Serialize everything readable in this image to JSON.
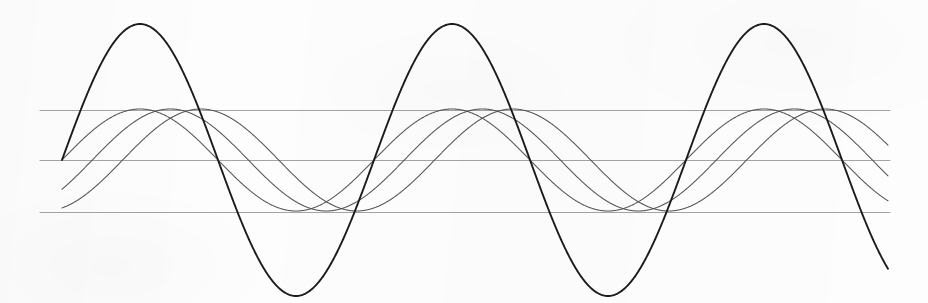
{
  "figure": {
    "background_color": "#fdfdfd",
    "width": 928,
    "height": 303
  },
  "chart_data": {
    "type": "line",
    "title": "",
    "xlabel": "",
    "ylabel": "",
    "grid": true,
    "legend_position": "none",
    "x_pixel_domain": [
      62,
      888
    ],
    "y_baseline_pixel": 160,
    "xlim": [
      0,
      2.65
    ],
    "ylim": [
      -1.0,
      1.0
    ],
    "x_unit": "periods",
    "gridlines": [
      {
        "name": "upper-gridline",
        "y_pixel": 110,
        "value": 0.385,
        "color": "#9a9a9a",
        "x_start": 40,
        "x_end": 890
      },
      {
        "name": "center-gridline",
        "y_pixel": 160,
        "value": 0.0,
        "color": "#9a9a9a",
        "x_start": 40,
        "x_end": 890
      },
      {
        "name": "lower-gridline",
        "y_pixel": 212,
        "value": -0.4,
        "color": "#9a9a9a",
        "x_start": 40,
        "x_end": 890
      }
    ],
    "series": [
      {
        "name": "fundamental-large-amplitude",
        "color": "#1c1c1c",
        "line_width": 1.9,
        "amplitude": 1.0,
        "amplitude_pixels": 136,
        "period_pixels": 312,
        "phase_degrees": 0,
        "x_start_pixel": 62,
        "x_end_pixel": 888,
        "peaks_pixel": [
          [
            155,
            24
          ],
          [
            467,
            24
          ],
          [
            779,
            24
          ]
        ],
        "troughs_pixel": [
          [
            311,
            289
          ],
          [
            623,
            289
          ]
        ]
      },
      {
        "name": "harmonic-phase-a",
        "color": "#555555",
        "line_width": 1.05,
        "amplitude": 0.375,
        "amplitude_pixels": 51,
        "period_pixels": 312,
        "phase_degrees": 0,
        "x_start_pixel": 62,
        "x_end_pixel": 888,
        "peaks_pixel": [
          [
            134,
            110
          ],
          [
            446,
            110
          ],
          [
            758,
            110
          ]
        ],
        "troughs_pixel": [
          [
            290,
            212
          ],
          [
            602,
            212
          ]
        ]
      },
      {
        "name": "harmonic-phase-b",
        "color": "#555555",
        "line_width": 1.05,
        "amplitude": 0.375,
        "amplitude_pixels": 51,
        "period_pixels": 312,
        "phase_degrees": -35,
        "x_start_pixel": 62,
        "x_end_pixel": 888,
        "peaks_pixel": [
          [
            165,
            110
          ],
          [
            477,
            110
          ],
          [
            789,
            110
          ]
        ],
        "troughs_pixel": [
          [
            321,
            212
          ],
          [
            633,
            212
          ]
        ]
      },
      {
        "name": "harmonic-phase-c",
        "color": "#555555",
        "line_width": 1.05,
        "amplitude": 0.375,
        "amplitude_pixels": 51,
        "period_pixels": 312,
        "phase_degrees": -70,
        "x_start_pixel": 62,
        "x_end_pixel": 888,
        "peaks_pixel": [
          [
            196,
            110
          ],
          [
            508,
            110
          ],
          [
            820,
            110
          ]
        ],
        "troughs_pixel": [
          [
            352,
            212
          ],
          [
            664,
            212
          ]
        ]
      }
    ]
  }
}
